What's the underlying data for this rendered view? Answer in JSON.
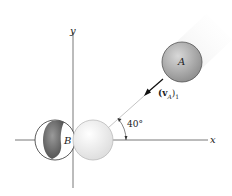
{
  "figure": {
    "axes": {
      "x_label": "x",
      "y_label": "y"
    },
    "ball_a": {
      "label": "A",
      "color": "#a8a8a8"
    },
    "ball_b": {
      "label": "B",
      "color": "#6e6e6e"
    },
    "velocity": {
      "label_main": "(v",
      "label_sub": "A",
      "label_close": ")",
      "label_index": "1"
    },
    "angle": {
      "label": "40°",
      "degrees": 40
    }
  }
}
